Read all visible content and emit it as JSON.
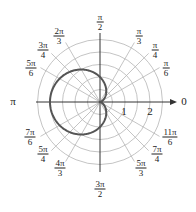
{
  "diagram": {
    "type": "polar_graph",
    "equation_hint": "cardioid r = 1 - cos(theta)",
    "colors": {
      "grid": "#b5b5b5",
      "axis": "#333333",
      "curve": "#555555"
    },
    "radial_labels": [
      "1",
      "2"
    ],
    "angle_labels": [
      {
        "id": "pi_over_2",
        "num": "π",
        "den": "2"
      },
      {
        "id": "pi_over_3",
        "num": "π",
        "den": "3"
      },
      {
        "id": "pi_over_4",
        "num": "π",
        "den": "4"
      },
      {
        "id": "pi_over_6",
        "num": "π",
        "den": "6"
      },
      {
        "id": "zero",
        "text": "0"
      },
      {
        "id": "two_pi_over_3",
        "num": "2π",
        "den": "3"
      },
      {
        "id": "three_pi_over_4",
        "num": "3π",
        "den": "4"
      },
      {
        "id": "five_pi_over_6",
        "num": "5π",
        "den": "6"
      },
      {
        "id": "pi",
        "text": "π"
      },
      {
        "id": "seven_pi_over_6",
        "num": "7π",
        "den": "6"
      },
      {
        "id": "five_pi_over_4",
        "num": "5π",
        "den": "4"
      },
      {
        "id": "four_pi_over_3",
        "num": "4π",
        "den": "3"
      },
      {
        "id": "three_pi_over_2",
        "num": "3π",
        "den": "2"
      },
      {
        "id": "five_pi_over_3",
        "num": "5π",
        "den": "3"
      },
      {
        "id": "seven_pi_over_4",
        "num": "7π",
        "den": "4"
      },
      {
        "id": "eleven_pi_over_6",
        "num": "11π",
        "den": "6"
      }
    ]
  }
}
